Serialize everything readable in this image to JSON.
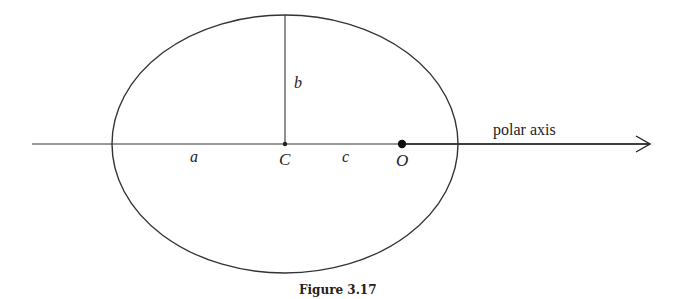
{
  "diagram": {
    "ellipse": {
      "cx": 285,
      "cy": 144,
      "rx": 173,
      "ry": 129,
      "stroke": "#333333"
    },
    "polar_axis": {
      "x1": 32,
      "x2": 650,
      "y": 144,
      "label": "polar axis"
    },
    "points": [
      {
        "id": "C",
        "label": "C",
        "x": 285,
        "y": 144
      },
      {
        "id": "O",
        "label": "O",
        "x": 402,
        "y": 144
      }
    ],
    "segments": {
      "a": "a",
      "b": "b",
      "c": "c"
    },
    "caption": "Figure 3.17"
  }
}
